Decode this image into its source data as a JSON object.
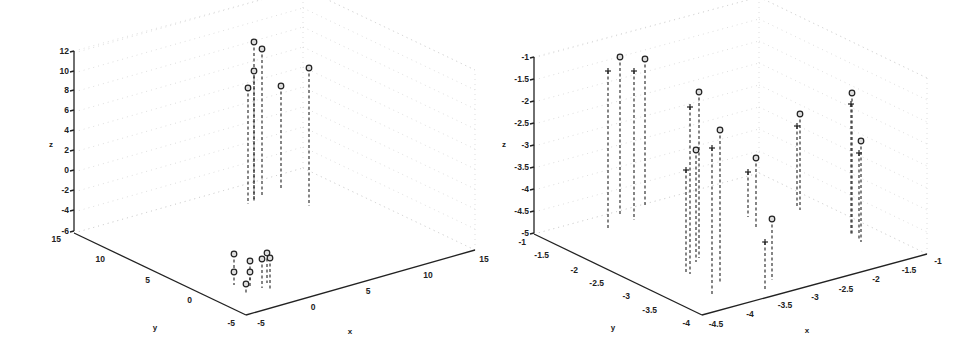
{
  "chart_data": [
    {
      "type": "scatter3d-stem",
      "title": "",
      "xlabel": "x",
      "ylabel": "y",
      "zlabel": "z",
      "xlim": [
        -5,
        15
      ],
      "ylim": [
        -5,
        15
      ],
      "zlim": [
        -6,
        12
      ],
      "x_ticks": [
        "-5",
        "0",
        "5",
        "10",
        "15"
      ],
      "y_ticks": [
        "-5",
        "0",
        "5",
        "10",
        "15"
      ],
      "z_ticks": [
        "12",
        "10",
        "8",
        "6",
        "4",
        "2",
        "0",
        "-2",
        "-4",
        "-6"
      ],
      "grid": true,
      "series": [
        {
          "name": "high cluster (o markers)",
          "marker": "o",
          "points_screen": [
            {
              "sx": 254,
              "sy": 42,
              "base": 200
            },
            {
              "sx": 262,
              "sy": 49,
              "base": 197
            },
            {
              "sx": 254,
              "sy": 71,
              "base": 201
            },
            {
              "sx": 248,
              "sy": 88,
              "base": 204
            },
            {
              "sx": 281,
              "sy": 86,
              "base": 190
            },
            {
              "sx": 309,
              "sy": 68,
              "base": 206
            }
          ],
          "approx_z": [
            11.8,
            11.2,
            9.8,
            8.5,
            8.6,
            10.0
          ]
        },
        {
          "name": "low cluster (o markers)",
          "marker": "o",
          "points_screen": [
            {
              "sx": 234,
              "sy": 254,
              "base": 270
            },
            {
              "sx": 234,
              "sy": 272,
              "base": 285
            },
            {
              "sx": 250,
              "sy": 261,
              "base": 280
            },
            {
              "sx": 250,
              "sy": 272,
              "base": 288
            },
            {
              "sx": 246,
              "sy": 284,
              "base": 295
            },
            {
              "sx": 262,
              "sy": 259,
              "base": 288
            },
            {
              "sx": 267,
              "sy": 253,
              "base": 283
            },
            {
              "sx": 270,
              "sy": 258,
              "base": 289
            }
          ]
        }
      ]
    },
    {
      "type": "scatter3d-stem",
      "title": "",
      "xlabel": "x",
      "ylabel": "y",
      "zlabel": "z",
      "xlim": [
        -4.5,
        -1
      ],
      "ylim": [
        -4,
        -1
      ],
      "zlim": [
        -5,
        -1
      ],
      "x_ticks": [
        "-4.5",
        "-4",
        "-3.5",
        "-3",
        "-2.5",
        "-2",
        "-1.5",
        "-1"
      ],
      "y_ticks": [
        "-4",
        "-3.5",
        "-3",
        "-2.5",
        "-2",
        "-1.5",
        "-1"
      ],
      "z_ticks": [
        "-1",
        "-1.5",
        "-2",
        "-2.5",
        "-3",
        "-3.5",
        "-4",
        "-4.5",
        "-5"
      ],
      "grid": true,
      "series": [
        {
          "name": "o markers",
          "marker": "o",
          "points_screen": [
            {
              "sx": 620,
              "sy": 57,
              "base": 215
            },
            {
              "sx": 645,
              "sy": 59,
              "base": 206
            },
            {
              "sx": 699,
              "sy": 92,
              "base": 258
            },
            {
              "sx": 696,
              "sy": 150,
              "base": 262
            },
            {
              "sx": 720,
              "sy": 130,
              "base": 283
            },
            {
              "sx": 756,
              "sy": 158,
              "base": 227
            },
            {
              "sx": 800,
              "sy": 114,
              "base": 210
            },
            {
              "sx": 852,
              "sy": 93,
              "base": 235
            },
            {
              "sx": 861,
              "sy": 141,
              "base": 242
            },
            {
              "sx": 772,
              "sy": 219,
              "base": 280
            }
          ]
        },
        {
          "name": "+ markers",
          "marker": "+",
          "points_screen": [
            {
              "sx": 608,
              "sy": 71,
              "base": 230
            },
            {
              "sx": 634,
              "sy": 71,
              "base": 220
            },
            {
              "sx": 690,
              "sy": 107,
              "base": 274
            },
            {
              "sx": 686,
              "sy": 170,
              "base": 272
            },
            {
              "sx": 712,
              "sy": 148,
              "base": 295
            },
            {
              "sx": 748,
              "sy": 172,
              "base": 217
            },
            {
              "sx": 797,
              "sy": 126,
              "base": 207
            },
            {
              "sx": 851,
              "sy": 104,
              "base": 236
            },
            {
              "sx": 859,
              "sy": 153,
              "base": 240
            },
            {
              "sx": 765,
              "sy": 242,
              "base": 289
            }
          ]
        }
      ]
    }
  ],
  "left_plot": {
    "z_axis": {
      "label": "z",
      "ticks": [
        {
          "t": "12",
          "y": 51
        },
        {
          "t": "10",
          "y": 71
        },
        {
          "t": "8",
          "y": 90
        },
        {
          "t": "6",
          "y": 110
        },
        {
          "t": "4",
          "y": 130
        },
        {
          "t": "2",
          "y": 150
        },
        {
          "t": "0",
          "y": 170
        },
        {
          "t": "-2",
          "y": 190
        },
        {
          "t": "-4",
          "y": 210
        },
        {
          "t": "-6",
          "y": 231
        }
      ]
    },
    "y_axis": {
      "label": "y",
      "ticks": [
        {
          "t": "15",
          "x": 61,
          "y": 242
        },
        {
          "t": "10",
          "x": 105,
          "y": 262
        },
        {
          "t": "5",
          "x": 150,
          "y": 283
        },
        {
          "t": "0",
          "x": 192,
          "y": 303
        },
        {
          "t": "-5",
          "x": 235,
          "y": 326
        }
      ]
    },
    "x_axis": {
      "label": "x",
      "ticks": [
        {
          "t": "-5",
          "x": 261,
          "y": 326
        },
        {
          "t": "0",
          "x": 313,
          "y": 310
        },
        {
          "t": "5",
          "x": 368,
          "y": 294
        },
        {
          "t": "10",
          "x": 428,
          "y": 278
        },
        {
          "t": "15",
          "x": 484,
          "y": 262
        }
      ]
    }
  },
  "right_plot": {
    "z_axis": {
      "label": "z",
      "ticks": [
        {
          "t": "-1",
          "y": 57
        },
        {
          "t": "-1.5",
          "y": 79
        },
        {
          "t": "-2",
          "y": 101
        },
        {
          "t": "-2.5",
          "y": 123
        },
        {
          "t": "-3",
          "y": 145
        },
        {
          "t": "-3.5",
          "y": 167
        },
        {
          "t": "-4",
          "y": 189
        },
        {
          "t": "-4.5",
          "y": 211
        },
        {
          "t": "-5",
          "y": 233
        }
      ]
    },
    "y_axis": {
      "label": "y",
      "ticks": [
        {
          "t": "-1",
          "x": 526,
          "y": 245
        },
        {
          "t": "-1.5",
          "x": 549,
          "y": 258
        },
        {
          "t": "-2",
          "x": 578,
          "y": 273
        },
        {
          "t": "-2.5",
          "x": 604,
          "y": 286
        },
        {
          "t": "-3",
          "x": 630,
          "y": 299
        },
        {
          "t": "-3.5",
          "x": 657,
          "y": 313
        },
        {
          "t": "-4",
          "x": 690,
          "y": 326
        }
      ]
    },
    "x_axis": {
      "label": "x",
      "ticks": [
        {
          "t": "-4.5",
          "x": 716,
          "y": 327
        },
        {
          "t": "-4",
          "x": 750,
          "y": 317
        },
        {
          "t": "-3.5",
          "x": 785,
          "y": 308
        },
        {
          "t": "-3",
          "x": 815,
          "y": 300
        },
        {
          "t": "-2.5",
          "x": 846,
          "y": 292
        },
        {
          "t": "-2",
          "x": 876,
          "y": 282
        },
        {
          "t": "-1.5",
          "x": 909,
          "y": 273
        },
        {
          "t": "-1",
          "x": 938,
          "y": 264
        }
      ]
    }
  }
}
